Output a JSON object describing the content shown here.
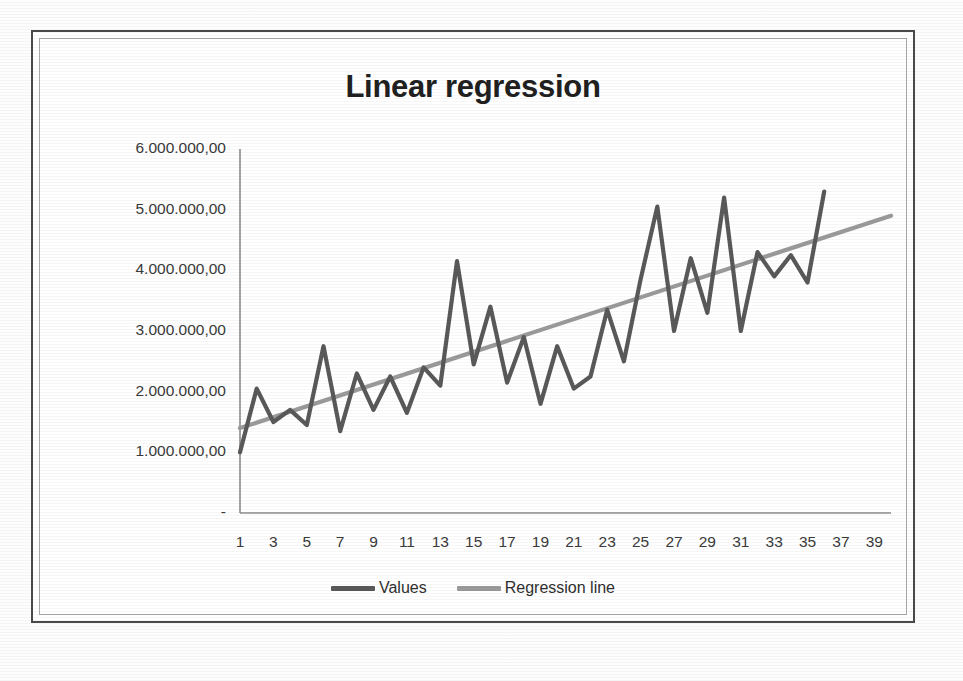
{
  "chart_data": {
    "type": "line",
    "title": "Linear regression",
    "xlabel": "",
    "ylabel": "",
    "grid": false,
    "legend_position": "bottom",
    "ylim": [
      0,
      6000000
    ],
    "xlim": [
      1,
      40
    ],
    "ytick_labels": [
      "6.000.000,00",
      "5.000.000,00",
      "4.000.000,00",
      "3.000.000,00",
      "2.000.000,00",
      "1.000.000,00",
      "-"
    ],
    "ytick_values": [
      6000000,
      5000000,
      4000000,
      3000000,
      2000000,
      1000000,
      0
    ],
    "xtick_labels": [
      "1",
      "3",
      "5",
      "7",
      "9",
      "11",
      "13",
      "15",
      "17",
      "19",
      "21",
      "23",
      "25",
      "27",
      "29",
      "31",
      "33",
      "35",
      "37",
      "39"
    ],
    "xtick_values": [
      1,
      3,
      5,
      7,
      9,
      11,
      13,
      15,
      17,
      19,
      21,
      23,
      25,
      27,
      29,
      31,
      33,
      35,
      37,
      39
    ],
    "x": [
      1,
      2,
      3,
      4,
      5,
      6,
      7,
      8,
      9,
      10,
      11,
      12,
      13,
      14,
      15,
      16,
      17,
      18,
      19,
      20,
      21,
      22,
      23,
      24,
      25,
      26,
      27,
      28,
      29,
      30,
      31,
      32,
      33,
      34,
      35,
      36
    ],
    "series": [
      {
        "name": "Values",
        "color": "#595959",
        "values": [
          1000000,
          2050000,
          1500000,
          1700000,
          1450000,
          2750000,
          1350000,
          2300000,
          1700000,
          2250000,
          1650000,
          2400000,
          2100000,
          4150000,
          2450000,
          3400000,
          2150000,
          2900000,
          1800000,
          2750000,
          2050000,
          2250000,
          3350000,
          2500000,
          3850000,
          5050000,
          3000000,
          4200000,
          3300000,
          5200000,
          3000000,
          4300000,
          3900000,
          4250000,
          3800000,
          5300000
        ]
      },
      {
        "name": "Regression line",
        "color": "#9a9a9a",
        "values": [
          1400000,
          1500000,
          1600000,
          1700000,
          1800000,
          1900000,
          2000000,
          2100000,
          2200000,
          2300000,
          2400000,
          2500000,
          2600000,
          2700000,
          2800000,
          2900000,
          3000000,
          3100000,
          3200000,
          3300000,
          3400000,
          3500000,
          3600000,
          3700000,
          3800000,
          3900000,
          4000000,
          4100000,
          4200000,
          4300000,
          4400000,
          4500000,
          4600000,
          4700000,
          4800000,
          4900000
        ],
        "x_end": 40,
        "trend_start": 1400000,
        "trend_end": 4900000
      }
    ]
  },
  "legend": {
    "entries": [
      {
        "label": "Values",
        "color": "#595959"
      },
      {
        "label": "Regression line",
        "color": "#9a9a9a"
      }
    ]
  },
  "axes": {
    "axis_color": "#8c8c8c",
    "label_color": "#3a3a3a"
  },
  "frame": {
    "outer_color": "#4a4a4a",
    "inner_color": "#a9a9a9"
  }
}
